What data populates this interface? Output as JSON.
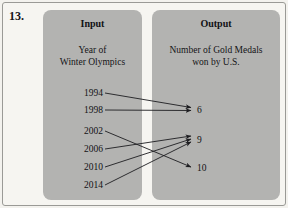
{
  "problem": {
    "number": "13."
  },
  "input_panel": {
    "header": "Input",
    "subtitle_line1": "Year of",
    "subtitle_line2": "Winter Olympics",
    "items": [
      {
        "label": "1994",
        "y": 94
      },
      {
        "label": "1998",
        "y": 111
      },
      {
        "label": "2002",
        "y": 132
      },
      {
        "label": "2006",
        "y": 150
      },
      {
        "label": "2010",
        "y": 168
      },
      {
        "label": "2014",
        "y": 186
      }
    ]
  },
  "output_panel": {
    "header": "Output",
    "subtitle_line1": "Number of Gold Medals",
    "subtitle_line2": "won by U.S.",
    "items": [
      {
        "label": "6",
        "y": 111
      },
      {
        "label": "9",
        "y": 141
      },
      {
        "label": "10",
        "y": 169
      }
    ]
  },
  "mappings": [
    {
      "from": "1994",
      "to": "6"
    },
    {
      "from": "1998",
      "to": "6"
    },
    {
      "from": "2002",
      "to": "10"
    },
    {
      "from": "2006",
      "to": "9"
    },
    {
      "from": "2010",
      "to": "9"
    },
    {
      "from": "2014",
      "to": "9"
    }
  ],
  "colors": {
    "panel_fill": "#b3b3b1",
    "page_background": "#f6f5f1",
    "line": "#1d1d20",
    "text": "#121215"
  }
}
